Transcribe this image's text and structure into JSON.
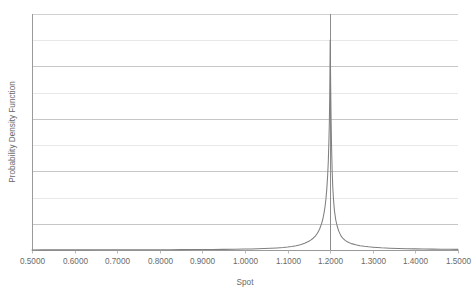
{
  "chart_data": {
    "type": "line",
    "title": "",
    "subtitle": "",
    "xlabel": "Spot",
    "ylabel": "Probability Density Function",
    "xlim": [
      0.5,
      1.5
    ],
    "ylim": [
      0,
      1
    ],
    "grid": true,
    "legend": null,
    "legend_position": "none",
    "x_tick_labels": [
      "0.5000",
      "0.6000",
      "0.7000",
      "0.8000",
      "0.9000",
      "1.0000",
      "1.1000",
      "1.2000",
      "1.3000",
      "1.4000",
      "1.5000"
    ],
    "x_tick_values": [
      0.5,
      0.6,
      0.7,
      0.8,
      0.9,
      1.0,
      1.1,
      1.2,
      1.3,
      1.4,
      1.5
    ],
    "y_tick_labels": [],
    "y_gridline_fractions": [
      0.0,
      0.111,
      0.222,
      0.333,
      0.444,
      0.556,
      0.667,
      0.778,
      0.889,
      1.0
    ],
    "annotations": [
      {
        "name": "reference-line",
        "type": "vline",
        "x": 1.2,
        "label": "",
        "color": "#8c8c8c"
      }
    ],
    "series": [
      {
        "name": "Probability Density Function",
        "color": "#7f7f7f",
        "x": [
          0.5,
          0.525,
          0.55,
          0.575,
          0.6,
          0.625,
          0.65,
          0.675,
          0.7,
          0.725,
          0.75,
          0.775,
          0.8,
          0.825,
          0.85,
          0.875,
          0.9,
          0.925,
          0.95,
          0.975,
          1.0,
          1.015,
          1.03,
          1.045,
          1.06,
          1.075,
          1.09,
          1.1,
          1.11,
          1.12,
          1.13,
          1.14,
          1.15,
          1.155,
          1.16,
          1.165,
          1.17,
          1.175,
          1.18,
          1.183,
          1.186,
          1.188,
          1.19,
          1.192,
          1.194,
          1.1955,
          1.197,
          1.198,
          1.199,
          1.1995,
          1.2,
          1.2005,
          1.201,
          1.202,
          1.203,
          1.2045,
          1.206,
          1.208,
          1.21,
          1.213,
          1.216,
          1.22,
          1.225,
          1.23,
          1.235,
          1.24,
          1.245,
          1.25,
          1.26,
          1.27,
          1.28,
          1.29,
          1.3,
          1.32,
          1.34,
          1.36,
          1.38,
          1.4,
          1.42,
          1.44,
          1.46,
          1.48,
          1.5
        ],
        "y": [
          0.0015,
          0.0016,
          0.0017,
          0.0018,
          0.002,
          0.0021,
          0.0023,
          0.0025,
          0.0027,
          0.003,
          0.0033,
          0.0036,
          0.004,
          0.0045,
          0.0051,
          0.0058,
          0.0067,
          0.0078,
          0.0092,
          0.011,
          0.0134,
          0.0152,
          0.0175,
          0.0204,
          0.0242,
          0.0293,
          0.0364,
          0.0428,
          0.051,
          0.0616,
          0.076,
          0.096,
          0.125,
          0.144,
          0.168,
          0.199,
          0.24,
          0.297,
          0.381,
          0.45,
          0.545,
          0.625,
          0.73,
          0.87,
          1.06,
          1.26,
          1.56,
          1.82,
          2.25,
          2.6,
          3.0,
          2.75,
          2.4,
          1.9,
          1.52,
          1.15,
          0.9,
          0.7,
          0.56,
          0.43,
          0.35,
          0.27,
          0.205,
          0.165,
          0.138,
          0.118,
          0.103,
          0.091,
          0.074,
          0.062,
          0.053,
          0.046,
          0.0405,
          0.032,
          0.0262,
          0.022,
          0.0188,
          0.0163,
          0.0143,
          0.0126,
          0.0113,
          0.0101,
          0.0092
        ]
      }
    ]
  },
  "axes": {
    "x_title": "Spot",
    "y_title": "Probability Density Function"
  }
}
